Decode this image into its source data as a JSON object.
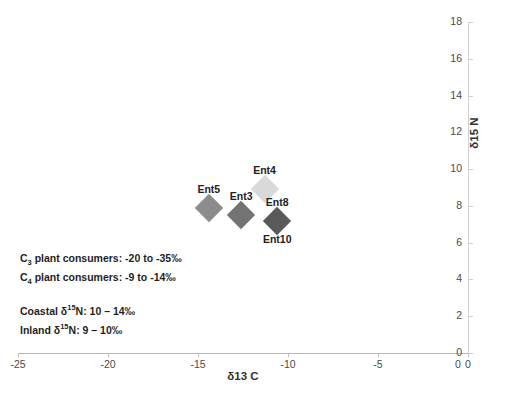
{
  "chart_data": {
    "type": "scatter",
    "title": "",
    "xlabel": "δ13 C",
    "ylabel": "δ15 N",
    "xlim": [
      -25,
      0
    ],
    "ylim": [
      0,
      18
    ],
    "xticks": [
      -25,
      -20,
      -15,
      -10,
      -5,
      0
    ],
    "yticks": [
      0,
      2,
      4,
      6,
      8,
      10,
      12,
      14,
      16,
      18
    ],
    "xtick_labels": [
      "-25",
      "-20",
      "-15",
      "-10",
      "-5",
      "0"
    ],
    "ytick_labels": [
      "0",
      "2",
      "4",
      "6",
      "8",
      "10",
      "12",
      "14",
      "16",
      "18"
    ],
    "origin_corner_label": "0",
    "grid": false,
    "legend": "none",
    "yaxis_position": "right",
    "points": [
      {
        "label": "Ent5",
        "x": -14.4,
        "y": 7.9,
        "color": "#8c8c8c",
        "label_position": "above"
      },
      {
        "label": "Ent3",
        "x": -12.6,
        "y": 7.5,
        "color": "#737373",
        "label_position": "above"
      },
      {
        "label": "Ent4",
        "x": -11.3,
        "y": 8.9,
        "color": "#d9d9d9",
        "label_position": "above"
      },
      {
        "label": "Ent8",
        "x": -10.6,
        "y": 7.2,
        "color": "#595959",
        "label_position": "above"
      },
      {
        "label": "Ent10",
        "x": -10.6,
        "y": 7.2,
        "color": "#595959",
        "label_position": "below"
      }
    ],
    "annotations": [
      {
        "id": "c3-consumers",
        "prefix": "C",
        "sub": "3",
        "text": " plant consumers: -20 to -35‰"
      },
      {
        "id": "c4-consumers",
        "prefix": "C",
        "sub": "4",
        "text": " plant consumers:  -9 to -14‰"
      },
      {
        "id": "coastal-n",
        "prefix": "Coastal δ",
        "sup": "15",
        "text": "N: 10 – 14‰"
      },
      {
        "id": "inland-n",
        "prefix": "Inland δ",
        "sup": "15",
        "text": "N: 9 – 10‰"
      }
    ]
  }
}
